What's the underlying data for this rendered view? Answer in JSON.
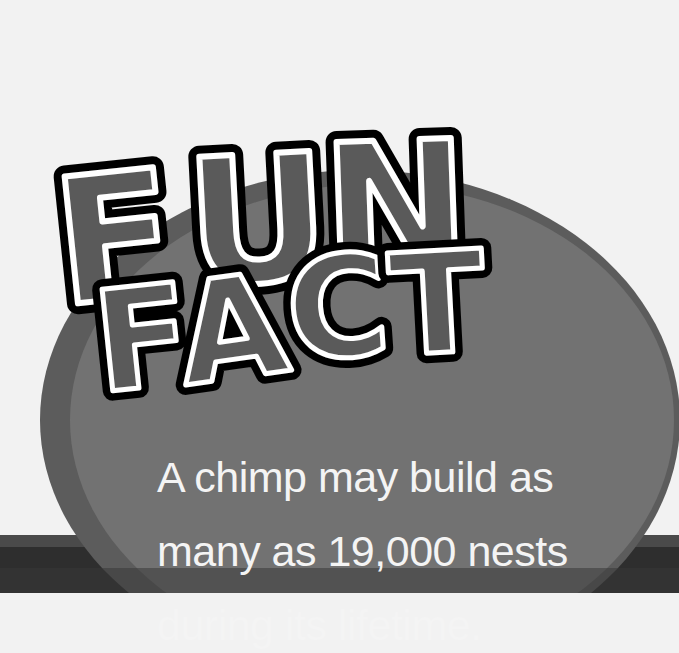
{
  "title": {
    "line1": "FUN",
    "line2": "FACT",
    "letters1": [
      "F",
      "U",
      "N"
    ],
    "letters2": [
      "F",
      "A",
      "C",
      "T"
    ]
  },
  "fact": {
    "lines": [
      "A chimp may build as",
      "many as 19,000 nests",
      "during its lifetime."
    ]
  },
  "colors": {
    "background": "#f2f2f2",
    "oval": "#6e6e6e",
    "oval_rim": "#595959",
    "band_dark": "#3a3a3a",
    "band_light": "#555555",
    "letter_fill": "#5a5a5a",
    "letter_stroke_outer": "#000000",
    "letter_stroke_inner": "#ffffff",
    "text": "#f4f4f4"
  }
}
